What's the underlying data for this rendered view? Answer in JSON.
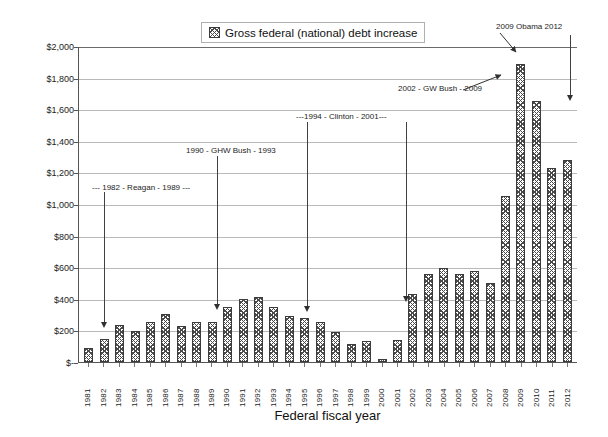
{
  "chart_data": {
    "type": "bar",
    "title": "",
    "legend_label": "Gross federal (national) debt increase",
    "legend_position": "top-center",
    "xlabel": "Federal fiscal year",
    "ylabel": "Current dollars in billions",
    "grid": true,
    "ylim": [
      0,
      2000
    ],
    "ytick_labels": [
      "$2,000",
      "$1,800",
      "$1,600",
      "$1,400",
      "$1,200",
      "$1,000",
      "$800",
      "$600",
      "$400",
      "$200",
      "$-"
    ],
    "ytick_values": [
      2000,
      1800,
      1600,
      1400,
      1200,
      1000,
      800,
      600,
      400,
      200,
      0
    ],
    "categories": [
      "1981",
      "1982",
      "1983",
      "1984",
      "1985",
      "1986",
      "1987",
      "1988",
      "1989",
      "1990",
      "1991",
      "1992",
      "1993",
      "1994",
      "1995",
      "1996",
      "1997",
      "1998",
      "1999",
      "2000",
      "2001",
      "2002",
      "2003",
      "2004",
      "2005",
      "2006",
      "2007",
      "2008",
      "2009",
      "2010",
      "2011",
      "2012"
    ],
    "values": [
      90,
      144,
      235,
      195,
      256,
      303,
      225,
      252,
      255,
      350,
      399,
      411,
      347,
      292,
      281,
      251,
      188,
      113,
      130,
      18,
      141,
      428,
      555,
      596,
      554,
      574,
      501,
      1048,
      1885,
      1652,
      1229,
      1276
    ],
    "annotations": [
      {
        "text": "--- 1982 -  Reagan - 1989 ---",
        "points_to": "1982"
      },
      {
        "text": "1990 - GHW Bush - 1993",
        "points_to": "1990"
      },
      {
        "text": "---1994 - Clinton - 2001---",
        "points_to": "1994"
      },
      {
        "text": "2002 - GW Bush - 2009",
        "points_to": "2002"
      },
      {
        "text": "2009 Obama 2012",
        "points_to": "2009"
      }
    ]
  },
  "legend": {
    "label": "Gross federal (national) debt increase"
  },
  "axes": {
    "y_title": "Current dollars in billions",
    "x_title": "Federal fiscal year",
    "y_ticks": [
      "$2,000",
      "$1,800",
      "$1,600",
      "$1,400",
      "$1,200",
      "$1,000",
      "$800",
      "$600",
      "$400",
      "$200",
      "$-"
    ],
    "x_ticks": [
      "1981",
      "1982",
      "1983",
      "1984",
      "1985",
      "1986",
      "1987",
      "1988",
      "1989",
      "1990",
      "1991",
      "1992",
      "1993",
      "1994",
      "1995",
      "1996",
      "1997",
      "1998",
      "1999",
      "2000",
      "2001",
      "2002",
      "2003",
      "2004",
      "2005",
      "2006",
      "2007",
      "2008",
      "2009",
      "2010",
      "2011",
      "2012"
    ]
  },
  "annotations": {
    "reagan": "--- 1982 -  Reagan - 1989 ---",
    "ghw_bush": "1990 - GHW Bush - 1993",
    "clinton": "---1994 - Clinton - 2001---",
    "gw_bush": "2002 - GW Bush - 2009",
    "obama": "2009 Obama 2012"
  },
  "colors": {
    "bar_ink": "#4a4a4a",
    "grid": "#b9b9b9",
    "axis": "#555555",
    "text": "#1c1c1c"
  }
}
